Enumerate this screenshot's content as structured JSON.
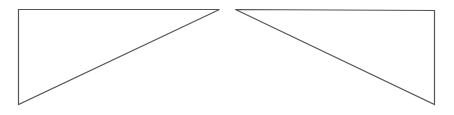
{
  "diagram": {
    "stroke_color": "#555555",
    "fill_color": "none",
    "background_color": "#ffffff",
    "shapes": [
      {
        "name": "left-triangle",
        "type": "right-triangle",
        "right_angle_corner": "top-left",
        "hypotenuse_direction": "top-right to bottom-left"
      },
      {
        "name": "right-triangle",
        "type": "right-triangle",
        "right_angle_corner": "top-right",
        "hypotenuse_direction": "top-left to bottom-right"
      }
    ]
  }
}
